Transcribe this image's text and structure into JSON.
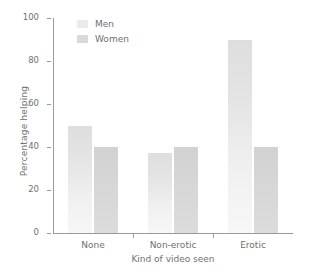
{
  "chart_data": {
    "type": "bar",
    "title": "",
    "xlabel": "Kind of video seen",
    "ylabel": "Percentage helping",
    "categories": [
      "None",
      "Non-erotic",
      "Erotic"
    ],
    "series": [
      {
        "name": "Men",
        "color": "#ebebeb",
        "values": [
          50,
          37,
          90
        ]
      },
      {
        "name": "Women",
        "color": "#d9d9d9",
        "values": [
          40,
          40,
          40
        ]
      }
    ],
    "ylim": [
      0,
      100
    ],
    "yticks": [
      0,
      20,
      40,
      60,
      80,
      100
    ],
    "ytick_labels": [
      "0",
      "20",
      "40",
      "60",
      "80",
      "100"
    ],
    "grid": false,
    "legend_position": "top-left",
    "legend_entries": [
      "Men",
      "Women"
    ]
  }
}
